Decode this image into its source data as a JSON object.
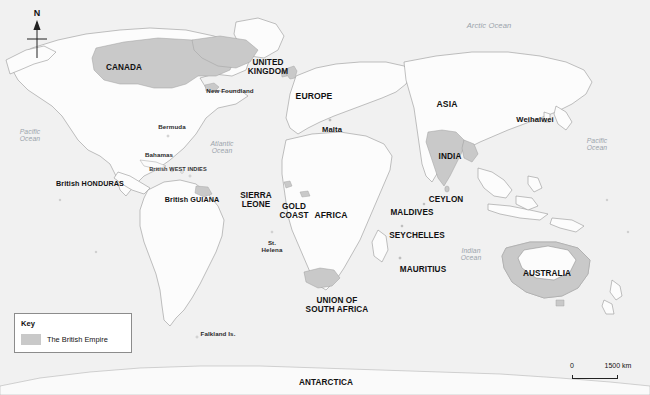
{
  "map": {
    "title": "The British Empire world map",
    "colors": {
      "background": "#f3f3f3",
      "ocean": "#f0f0f0",
      "land": "#fbfbfb",
      "land_outline": "#8d8d8d",
      "empire_fill": "#c9c9c9",
      "empire_outline": "#9a9a9a",
      "label_text": "#111111",
      "ocean_text": "#9aa3ab",
      "legend_border": "#8c8c8c"
    },
    "compass": {
      "north_letter": "N",
      "icon": "compass-north-arrow-icon"
    },
    "legend": {
      "title": "Key",
      "entries": [
        {
          "label": "The British Empire",
          "color": "#c9c9c9"
        }
      ]
    },
    "scalebar": {
      "min_label": "0",
      "max_label": "1500 km"
    },
    "oceans": [
      {
        "name": "Arctic Ocean",
        "lines": [
          "Arctic Ocean"
        ],
        "x": 489,
        "y": 22
      },
      {
        "name": "Pacific Ocean West",
        "lines": [
          "Pacific",
          "Ocean"
        ],
        "x": 30,
        "y": 128
      },
      {
        "name": "Atlantic Ocean",
        "lines": [
          "Atlantic",
          "Ocean"
        ],
        "x": 222,
        "y": 140
      },
      {
        "name": "Pacific Ocean East",
        "lines": [
          "Pacific",
          "Ocean"
        ],
        "x": 597,
        "y": 137
      },
      {
        "name": "Indian Ocean",
        "lines": [
          "Indian",
          "Ocean"
        ],
        "x": 471,
        "y": 247
      }
    ],
    "labels": [
      {
        "name": "canada",
        "lines": [
          "CANADA"
        ],
        "x": 124,
        "y": 64,
        "style": "country-caps"
      },
      {
        "name": "new-foundland",
        "lines": [
          "New Foundland"
        ],
        "x": 230,
        "y": 88,
        "style": "small"
      },
      {
        "name": "united-kingdom",
        "lines": [
          "UNITED",
          "KINGDOM"
        ],
        "x": 268,
        "y": 59,
        "style": "country-caps"
      },
      {
        "name": "europe",
        "lines": [
          "EUROPE"
        ],
        "x": 314,
        "y": 92,
        "style": "continent"
      },
      {
        "name": "malta",
        "lines": [
          "Malta"
        ],
        "x": 332,
        "y": 126,
        "style": "country"
      },
      {
        "name": "asia",
        "lines": [
          "ASIA"
        ],
        "x": 447,
        "y": 100,
        "style": "continent"
      },
      {
        "name": "weihaiwei",
        "lines": [
          "Weihaiwei"
        ],
        "x": 535,
        "y": 116,
        "style": "country"
      },
      {
        "name": "bermuda",
        "lines": [
          "Bermuda"
        ],
        "x": 172,
        "y": 124,
        "style": "small"
      },
      {
        "name": "bahamas",
        "lines": [
          "Bahamas"
        ],
        "x": 159,
        "y": 152,
        "style": "small"
      },
      {
        "name": "british-west-indies",
        "lines": [
          "British WEST INDIES"
        ],
        "x": 178,
        "y": 166,
        "style": "tiny"
      },
      {
        "name": "british-honduras",
        "lines": [
          "British HONDURAS"
        ],
        "x": 90,
        "y": 180,
        "style": "mixed"
      },
      {
        "name": "british-guiana",
        "lines": [
          "British GUIANA"
        ],
        "x": 192,
        "y": 196,
        "style": "mixed"
      },
      {
        "name": "india",
        "lines": [
          "INDIA"
        ],
        "x": 450,
        "y": 153,
        "style": "country-caps"
      },
      {
        "name": "ceylon",
        "lines": [
          "CEYLON"
        ],
        "x": 446,
        "y": 196,
        "style": "country-caps"
      },
      {
        "name": "maldives",
        "lines": [
          "MALDIVES"
        ],
        "x": 412,
        "y": 209,
        "style": "country-caps"
      },
      {
        "name": "seychelles",
        "lines": [
          "SEYCHELLES"
        ],
        "x": 417,
        "y": 232,
        "style": "country-caps"
      },
      {
        "name": "mauritius",
        "lines": [
          "MAURITIUS"
        ],
        "x": 423,
        "y": 266,
        "style": "country-caps"
      },
      {
        "name": "sierra-leone",
        "lines": [
          "SIERRA",
          "LEONE"
        ],
        "x": 256,
        "y": 192,
        "style": "country-caps"
      },
      {
        "name": "gold-coast",
        "lines": [
          "GOLD",
          "COAST"
        ],
        "x": 294,
        "y": 203,
        "style": "country-caps"
      },
      {
        "name": "africa",
        "lines": [
          "AFRICA"
        ],
        "x": 331,
        "y": 211,
        "style": "continent"
      },
      {
        "name": "st-helena",
        "lines": [
          "St.",
          "Helena"
        ],
        "x": 272,
        "y": 240,
        "style": "small"
      },
      {
        "name": "union-of-south-africa",
        "lines": [
          "UNION OF",
          "SOUTH AFRICA"
        ],
        "x": 337,
        "y": 297,
        "style": "country-caps"
      },
      {
        "name": "australia",
        "lines": [
          "AUSTRALIA"
        ],
        "x": 547,
        "y": 270,
        "style": "country-caps"
      },
      {
        "name": "falkland-islands",
        "lines": [
          "Falkland Is."
        ],
        "x": 218,
        "y": 331,
        "style": "small"
      },
      {
        "name": "antarctica",
        "lines": [
          "ANTARCTICA"
        ],
        "x": 326,
        "y": 379,
        "style": "country-caps"
      }
    ]
  }
}
